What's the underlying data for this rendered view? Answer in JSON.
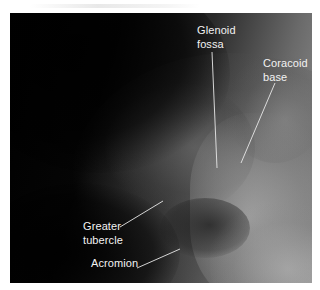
{
  "figure": {
    "background_color": "#ffffff",
    "label_color": "#f2f2f2",
    "labels": [
      {
        "id": "glenoid-fossa",
        "lines": [
          "Glenoid",
          "fossa"
        ],
        "x": 197,
        "y": 23,
        "leader": {
          "x1": 212,
          "y1": 52,
          "x2": 217,
          "y2": 168
        }
      },
      {
        "id": "coracoid-base",
        "lines": [
          "Coracoid",
          "base"
        ],
        "x": 263,
        "y": 56,
        "leader": {
          "x1": 275,
          "y1": 83,
          "x2": 241,
          "y2": 163
        }
      },
      {
        "id": "greater-tubercle",
        "lines": [
          "Greater",
          "tubercle"
        ],
        "x": 83,
        "y": 219,
        "leader": {
          "x1": 120,
          "y1": 227,
          "x2": 163,
          "y2": 201
        }
      },
      {
        "id": "acromion",
        "lines": [
          "Acromion"
        ],
        "x": 91,
        "y": 256,
        "leader": {
          "x1": 137,
          "y1": 268,
          "x2": 180,
          "y2": 249
        }
      }
    ]
  }
}
